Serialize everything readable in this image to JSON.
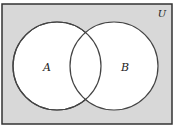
{
  "diagram": {
    "type": "venn",
    "universe_label": "U",
    "sets": [
      {
        "name": "A",
        "label": "A"
      },
      {
        "name": "B",
        "label": "B"
      }
    ],
    "colors": {
      "universe_fill": "#d8d8d8",
      "universe_border": "#333333",
      "circle_fill": "#ffffff",
      "circle_stroke": "#444444"
    },
    "caption": ""
  }
}
